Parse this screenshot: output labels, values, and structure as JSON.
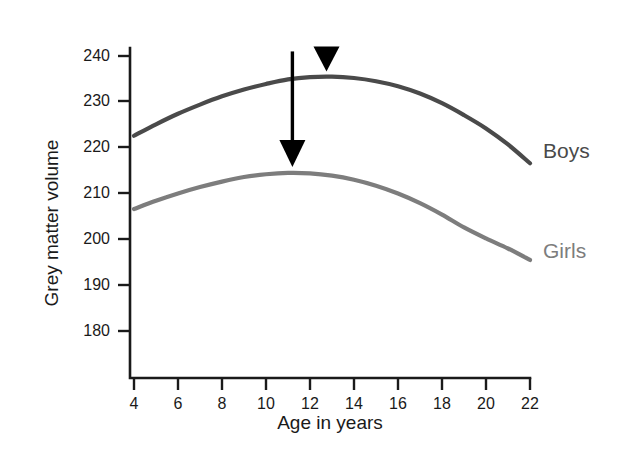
{
  "chart_data": {
    "type": "line",
    "title": "",
    "xlabel": "Age in years",
    "ylabel": "Grey matter volume",
    "xlim": [
      4,
      22
    ],
    "ylim": [
      175,
      242
    ],
    "xticks": [
      4,
      6,
      8,
      10,
      12,
      14,
      16,
      18,
      20,
      22
    ],
    "yticks": [
      180,
      190,
      200,
      210,
      220,
      230,
      240
    ],
    "grid": false,
    "legend_position": "right-of-curve-ends",
    "series": [
      {
        "name": "Boys",
        "color": "#4a4a4a",
        "peak_x": 12.7,
        "peak_y": 235.5,
        "x": [
          4,
          5,
          6,
          7,
          8,
          9,
          10,
          11,
          12,
          13,
          14,
          15,
          16,
          17,
          18,
          19,
          20,
          21,
          22
        ],
        "values": [
          222.6,
          225.1,
          227.4,
          229.4,
          231.2,
          232.7,
          233.9,
          234.9,
          235.4,
          235.5,
          235.2,
          234.5,
          233.4,
          231.8,
          229.7,
          227.1,
          224.2,
          220.7,
          216.6
        ]
      },
      {
        "name": "Girls",
        "color": "#7d7d7d",
        "peak_x": 11.2,
        "peak_y": 214.5,
        "x": [
          4,
          5,
          6,
          7,
          8,
          9,
          10,
          11,
          12,
          13,
          14,
          15,
          16,
          17,
          18,
          19,
          20,
          21,
          22
        ],
        "values": [
          206.6,
          208.4,
          210.0,
          211.4,
          212.6,
          213.6,
          214.2,
          214.5,
          214.4,
          213.9,
          213.0,
          211.7,
          210.0,
          207.9,
          205.4,
          202.6,
          200.2,
          198.0,
          195.5
        ]
      }
    ],
    "annotations": [
      {
        "name": "girls-peak-arrow",
        "kind": "down-arrow",
        "color": "#000000",
        "x": 11.2,
        "y_start": 241.0,
        "y_end": 215.8,
        "length": "long"
      },
      {
        "name": "boys-peak-arrow",
        "kind": "down-arrow",
        "color": "#000000",
        "x": 12.75,
        "y_start": 240.0,
        "y_end": 236.6,
        "length": "short"
      }
    ]
  },
  "axes": {
    "y_title": "Grey matter volume",
    "x_title": "Age in years",
    "y_tick_labels": [
      "240",
      "230",
      "220",
      "210",
      "200",
      "190",
      "180"
    ],
    "x_tick_labels": [
      "4",
      "6",
      "8",
      "10",
      "12",
      "14",
      "16",
      "18",
      "20",
      "22"
    ],
    "axis_color": "#1a1a1a"
  },
  "labels": {
    "boys": "Boys",
    "girls": "Girls"
  }
}
